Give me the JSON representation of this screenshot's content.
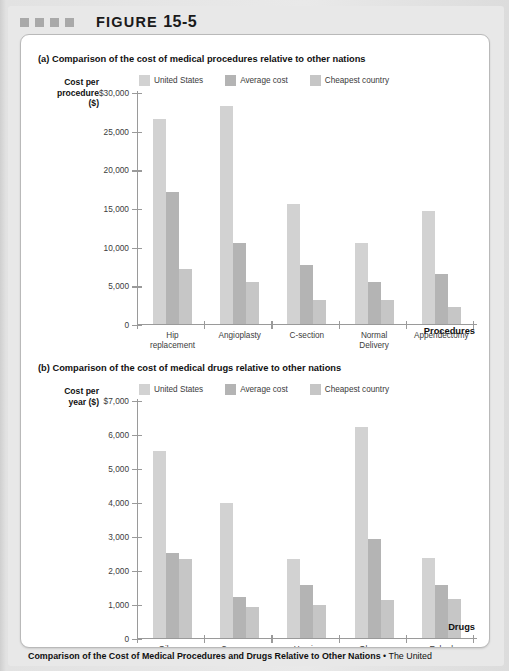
{
  "figure": {
    "header_label": "FIGURE",
    "header_number": "15-5",
    "decor_squares": 4,
    "caption_bold": "Comparison of the Cost of Medical Procedures and Drugs Relative to Other Nations",
    "caption_separator": " • ",
    "caption_body": "The United"
  },
  "colors": {
    "series_united_states": "#d2d2d2",
    "series_average_cost": "#b4b4b4",
    "series_cheapest_country": "#c6c6c6",
    "axis": "#9a9a9a",
    "card_background": "#ffffff",
    "page_background": "#e8e8e8",
    "decor_square": "#a9a9a9"
  },
  "legend_labels": [
    "United States",
    "Average cost",
    "Cheapest country"
  ],
  "panel_a": {
    "title": "(a) Comparison of the cost of medical procedures relative to other nations",
    "axis_title_lines": [
      "Cost per",
      "procedure",
      "($)"
    ],
    "x_axis_caption": "Procedures",
    "y_tick_labels": [
      "$30,000",
      "25,000",
      "20,000",
      "15,000",
      "10,000",
      "5,000",
      "0"
    ]
  },
  "panel_b": {
    "title": "(b) Comparison of the cost of medical drugs relative to other nations",
    "axis_title_lines": [
      "Cost per",
      "year ($)"
    ],
    "x_axis_caption": "Drugs",
    "y_tick_labels": [
      "$7,000",
      "6,000",
      "5,000",
      "4,000",
      "3,000",
      "2,000",
      "1,000",
      "0"
    ]
  },
  "chart_data": [
    {
      "type": "bar",
      "id": "panel-a",
      "title": "(a) Comparison of the cost of medical procedures relative to other nations",
      "xlabel": "Procedures",
      "ylabel": "Cost per procedure ($)",
      "ylim": [
        0,
        30000
      ],
      "yticks": [
        0,
        5000,
        10000,
        15000,
        20000,
        25000,
        30000
      ],
      "ytick_labels": [
        "0",
        "5,000",
        "10,000",
        "15,000",
        "20,000",
        "25,000",
        "$30,000"
      ],
      "grid": false,
      "legend_position": "top",
      "categories": [
        "Hip replacement",
        "Angioplasty",
        "C-section",
        "Normal Delivery",
        "Appendectomy"
      ],
      "series": [
        {
          "name": "United States",
          "color": "#d2d2d2",
          "values": [
            26500,
            28200,
            15500,
            10400,
            14500
          ]
        },
        {
          "name": "Average cost",
          "color": "#b4b4b4",
          "values": [
            17000,
            10400,
            7600,
            5400,
            6400
          ]
        },
        {
          "name": "Cheapest country",
          "color": "#c6c6c6",
          "values": [
            7000,
            5400,
            3000,
            3100,
            2100
          ]
        }
      ]
    },
    {
      "type": "bar",
      "id": "panel-b",
      "title": "(b) Comparison of the cost of medical drugs relative to other nations",
      "xlabel": "Drugs",
      "ylabel": "Cost per year ($)",
      "ylim": [
        0,
        7000
      ],
      "yticks": [
        0,
        1000,
        2000,
        3000,
        4000,
        5000,
        6000,
        7000
      ],
      "ytick_labels": [
        "0",
        "1,000",
        "2,000",
        "3,000",
        "4,000",
        "5,000",
        "6,000",
        "$7,000"
      ],
      "grid": false,
      "legend_position": "top",
      "categories": [
        "Gilenya",
        "Copaxone",
        "Humira",
        "Gleevec",
        "Enbrel"
      ],
      "series": [
        {
          "name": "United States",
          "color": "#d2d2d2",
          "values": [
            5500,
            3950,
            2300,
            6200,
            2350
          ]
        },
        {
          "name": "Average cost",
          "color": "#b4b4b4",
          "values": [
            2500,
            1200,
            1550,
            2900,
            1550
          ]
        },
        {
          "name": "Cheapest country",
          "color": "#c6c6c6",
          "values": [
            2300,
            900,
            950,
            1100,
            1150
          ]
        }
      ]
    }
  ]
}
